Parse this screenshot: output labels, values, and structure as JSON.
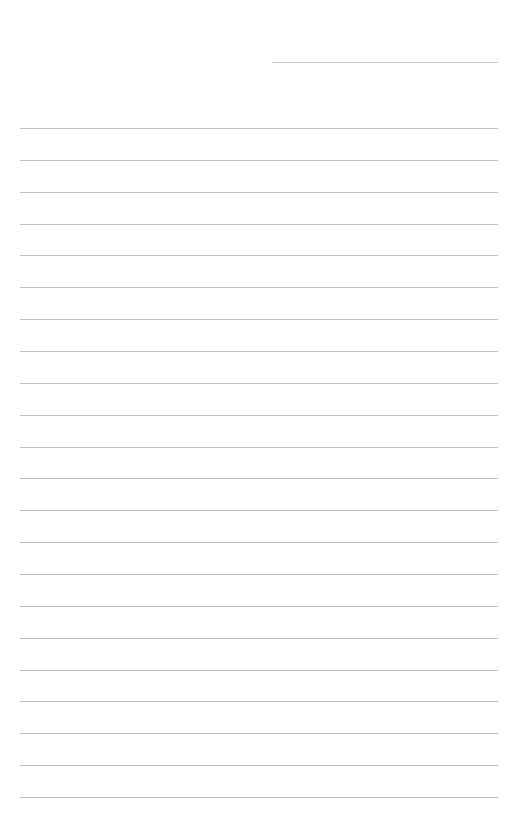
{
  "document": {
    "type": "blank-ruled-page",
    "title": "",
    "background_color": "#ffffff",
    "width_px": 505,
    "height_px": 831,
    "body_text": "",
    "placeholder_note": ""
  },
  "style": {
    "rule_color": "#c0c0c0",
    "short_rule_color": "#c6c6c6",
    "rule_thickness_px": 1,
    "page_background": "#ffffff"
  },
  "layout": {
    "left_margin_px": 20,
    "right_margin_px": 7,
    "top_margin_px": 52,
    "bottom_margin_px": 34,
    "line_spacing_px": 31.85
  },
  "header_rule": {
    "name": "date-line",
    "label": "",
    "value": "",
    "x_start_px": 272,
    "x_end_px": 498,
    "y_px": 62,
    "width_px": 226
  },
  "body_rules": [
    {
      "index": 1,
      "y_px": 128.0,
      "x_start_px": 20,
      "x_end_px": 498,
      "value": ""
    },
    {
      "index": 2,
      "y_px": 159.9,
      "x_start_px": 20,
      "x_end_px": 498,
      "value": ""
    },
    {
      "index": 3,
      "y_px": 191.7,
      "x_start_px": 20,
      "x_end_px": 498,
      "value": ""
    },
    {
      "index": 4,
      "y_px": 223.6,
      "x_start_px": 20,
      "x_end_px": 498,
      "value": ""
    },
    {
      "index": 5,
      "y_px": 255.4,
      "x_start_px": 20,
      "x_end_px": 498,
      "value": ""
    },
    {
      "index": 6,
      "y_px": 287.3,
      "x_start_px": 20,
      "x_end_px": 498,
      "value": ""
    },
    {
      "index": 7,
      "y_px": 319.1,
      "x_start_px": 20,
      "x_end_px": 498,
      "value": ""
    },
    {
      "index": 8,
      "y_px": 351.0,
      "x_start_px": 20,
      "x_end_px": 498,
      "value": ""
    },
    {
      "index": 9,
      "y_px": 382.8,
      "x_start_px": 20,
      "x_end_px": 498,
      "value": ""
    },
    {
      "index": 10,
      "y_px": 414.7,
      "x_start_px": 20,
      "x_end_px": 498,
      "value": ""
    },
    {
      "index": 11,
      "y_px": 446.5,
      "x_start_px": 20,
      "x_end_px": 498,
      "value": ""
    },
    {
      "index": 12,
      "y_px": 478.4,
      "x_start_px": 20,
      "x_end_px": 498,
      "value": ""
    },
    {
      "index": 13,
      "y_px": 510.2,
      "x_start_px": 20,
      "x_end_px": 498,
      "value": ""
    },
    {
      "index": 14,
      "y_px": 542.1,
      "x_start_px": 20,
      "x_end_px": 498,
      "value": ""
    },
    {
      "index": 15,
      "y_px": 573.9,
      "x_start_px": 20,
      "x_end_px": 498,
      "value": ""
    },
    {
      "index": 16,
      "y_px": 605.8,
      "x_start_px": 20,
      "x_end_px": 498,
      "value": ""
    },
    {
      "index": 17,
      "y_px": 637.6,
      "x_start_px": 20,
      "x_end_px": 498,
      "value": ""
    },
    {
      "index": 18,
      "y_px": 669.5,
      "x_start_px": 20,
      "x_end_px": 498,
      "value": ""
    },
    {
      "index": 19,
      "y_px": 701.3,
      "x_start_px": 20,
      "x_end_px": 498,
      "value": ""
    },
    {
      "index": 20,
      "y_px": 733.2,
      "x_start_px": 20,
      "x_end_px": 498,
      "value": ""
    },
    {
      "index": 21,
      "y_px": 765.0,
      "x_start_px": 20,
      "x_end_px": 498,
      "value": ""
    },
    {
      "index": 22,
      "y_px": 796.9,
      "x_start_px": 20,
      "x_end_px": 498,
      "value": ""
    }
  ]
}
